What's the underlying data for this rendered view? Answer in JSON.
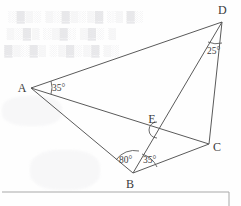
{
  "figure": {
    "stroke_color": "#5a5a5a",
    "label_color": "#3b3b3b",
    "background_color": "#fefefe",
    "points": [
      {
        "id": "A",
        "label": "A",
        "x": 31,
        "y": 88,
        "label_x": 22,
        "label_y": 92
      },
      {
        "id": "B",
        "label": "B",
        "x": 133,
        "y": 173,
        "label_x": 130,
        "label_y": 188
      },
      {
        "id": "C",
        "label": "C",
        "x": 209,
        "y": 144,
        "label_x": 213,
        "label_y": 151
      },
      {
        "id": "D",
        "label": "D",
        "x": 222,
        "y": 22,
        "label_x": 218,
        "label_y": 14
      },
      {
        "id": "E",
        "label": "E",
        "x": 157,
        "y": 128,
        "label_x": 152,
        "label_y": 123
      }
    ],
    "segments": [
      {
        "id": "AD",
        "from": "A",
        "to": "D"
      },
      {
        "id": "AC",
        "from": "A",
        "to": "C"
      },
      {
        "id": "AB",
        "from": "A",
        "to": "B"
      },
      {
        "id": "BC",
        "from": "B",
        "to": "C"
      },
      {
        "id": "BD",
        "from": "B",
        "to": "D"
      },
      {
        "id": "DC",
        "from": "D",
        "to": "C"
      }
    ],
    "angles": [
      {
        "id": "angle-A-DAC",
        "vertex": "A",
        "value": "35°",
        "label_x": 52,
        "label_y": 91
      },
      {
        "id": "angle-D-BDC",
        "vertex": "D",
        "value": "25°",
        "label_x": 207,
        "label_y": 54
      },
      {
        "id": "angle-B-ABD",
        "vertex": "B",
        "value": "80°",
        "label_x": 119,
        "label_y": 163
      },
      {
        "id": "angle-B-DBC",
        "vertex": "B",
        "value": "35°",
        "label_x": 143,
        "label_y": 163
      }
    ],
    "marks": [
      {
        "id": "arc-at-E",
        "kind": "angle-arc",
        "x": 152,
        "y": 131
      }
    ]
  },
  "page": {
    "box_label": "content-box-border",
    "bleed_text": [
      " ░▓ ▒░ ▓▒░▒▓░▒ ░▒▓░",
      "▒ ░▓▒ ░▓▒░ ▒▓░▒",
      "░▒ ▓▒░▓▒░ ▒▓░▒▓"
    ]
  }
}
